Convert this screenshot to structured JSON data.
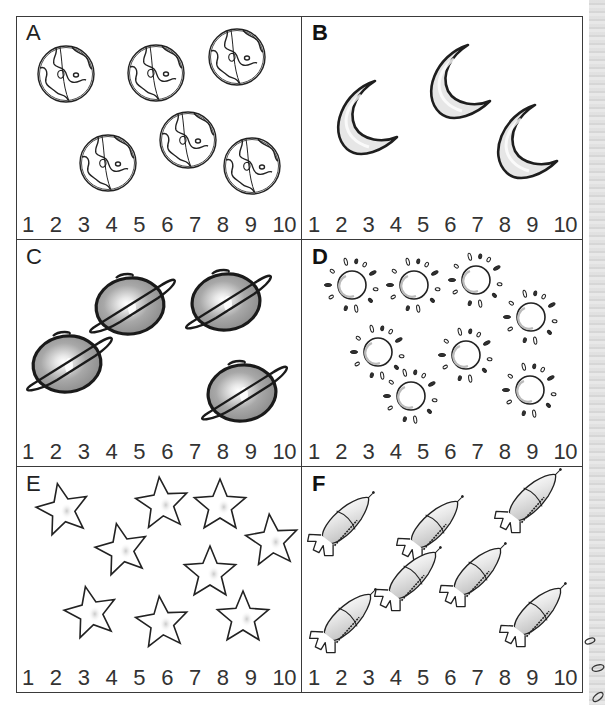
{
  "worksheet": {
    "type": "count-and-circle",
    "number_line": [
      "1",
      "2",
      "3",
      "4",
      "5",
      "6",
      "7",
      "8",
      "9",
      "10"
    ],
    "panels": [
      {
        "id": "A",
        "letter": "A",
        "object": "earth-globe",
        "count": 6,
        "box": {
          "x": 16,
          "y": 16,
          "w": 286,
          "h": 224
        },
        "items": [
          [
            66,
            74
          ],
          [
            156,
            73
          ],
          [
            237,
            57
          ],
          [
            108,
            163
          ],
          [
            188,
            140
          ],
          [
            252,
            166
          ]
        ]
      },
      {
        "id": "B",
        "letter": "B",
        "object": "crescent-moon",
        "count": 3,
        "box": {
          "x": 302,
          "y": 16,
          "w": 281,
          "h": 224
        },
        "items": [
          [
            365,
            125
          ],
          [
            458,
            89
          ],
          [
            525,
            149
          ]
        ]
      },
      {
        "id": "C",
        "letter": "C",
        "object": "ringed-planet",
        "count": 4,
        "box": {
          "x": 16,
          "y": 240,
          "w": 286,
          "h": 227
        },
        "items": [
          [
            130,
            306
          ],
          [
            226,
            302
          ],
          [
            67,
            364
          ],
          [
            242,
            393
          ]
        ]
      },
      {
        "id": "D",
        "letter": "D",
        "object": "sun",
        "count": 8,
        "box": {
          "x": 302,
          "y": 240,
          "w": 281,
          "h": 227
        },
        "items": [
          [
            352,
            285
          ],
          [
            414,
            285
          ],
          [
            476,
            280
          ],
          [
            531,
            317
          ],
          [
            378,
            352
          ],
          [
            466,
            355
          ],
          [
            411,
            396
          ],
          [
            530,
            390
          ]
        ]
      },
      {
        "id": "E",
        "letter": "E",
        "object": "star",
        "count": 9,
        "box": {
          "x": 16,
          "y": 467,
          "w": 286,
          "h": 226
        },
        "items": [
          [
            63,
            510
          ],
          [
            162,
            504
          ],
          [
            220,
            506
          ],
          [
            122,
            550
          ],
          [
            272,
            541
          ],
          [
            210,
            573
          ],
          [
            91,
            613
          ],
          [
            162,
            623
          ],
          [
            243,
            618
          ]
        ]
      },
      {
        "id": "F",
        "letter": "F",
        "object": "rocket",
        "count": 7,
        "box": {
          "x": 302,
          "y": 467,
          "w": 281,
          "h": 226
        },
        "items": [
          [
            343,
            523
          ],
          [
            432,
            527
          ],
          [
            530,
            500
          ],
          [
            345,
            620
          ],
          [
            410,
            578
          ],
          [
            475,
            574
          ],
          [
            535,
            614
          ]
        ]
      }
    ]
  },
  "colors": {
    "line": "#3a3a3a",
    "ink": "#222222",
    "fill_light": "#d8d8d8",
    "fill_planet": "#9a9a9a",
    "paper_edge": "#cfcfcf"
  }
}
